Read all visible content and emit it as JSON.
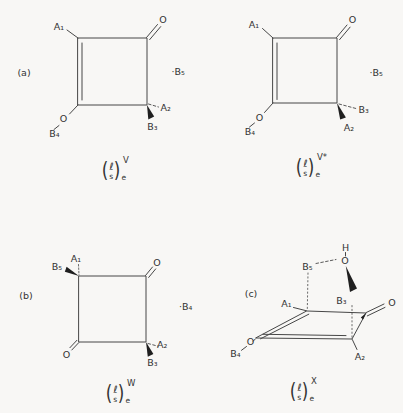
{
  "figure": {
    "background": "#f8f7f5",
    "ink": "#474747"
  },
  "panels": {
    "a": "(a)",
    "b": "(b)",
    "c": "(c)"
  },
  "captions": {
    "v": {
      "open": "(",
      "num": "ℓ",
      "den": "s",
      "close": ")",
      "sub": "e",
      "sup": "V"
    },
    "vstar": {
      "open": "(",
      "num": "ℓ",
      "den": "s",
      "close": ")",
      "sub": "e",
      "sup": "V*"
    },
    "w": {
      "open": "(",
      "num": "ℓ",
      "den": "s",
      "close": ")",
      "sub": "e",
      "sup": "W"
    },
    "x": {
      "open": "(",
      "num": "ℓ",
      "den": "s",
      "close": ")",
      "sub": "e",
      "sup": "X"
    }
  },
  "structures": {
    "v": {
      "atoms": {
        "a1": "A₁",
        "carbonyl_o": "O",
        "radical_b5": "·B₅",
        "a2": "A₂",
        "b3": "B₃",
        "enol_o": "O",
        "b4": "B₄"
      }
    },
    "v_star": {
      "atoms": {
        "a1": "A₁",
        "carbonyl_o": "O",
        "radical_b5": "·B₅",
        "b3": "B₃",
        "a2": "A₂",
        "enol_o": "O",
        "b4": "B₄"
      }
    },
    "w": {
      "atoms": {
        "a1": "A₁",
        "b5": "B₅",
        "carbonyl_o_top": "O",
        "carbonyl_o_bottom": "O",
        "a2": "A₂",
        "b3": "B₃",
        "radical_b4": "·B₄"
      }
    },
    "x": {
      "atoms": {
        "h": "H",
        "hydroxyl_o": "O",
        "b5": "B₅",
        "b3": "B₃",
        "a1": "A₁",
        "a2": "A₂",
        "carbonyl_o": "O",
        "enol_o": "O",
        "b4": "B₄"
      }
    }
  }
}
